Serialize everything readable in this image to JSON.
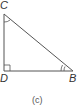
{
  "figure": {
    "caption": "(c)",
    "vertices": {
      "C": {
        "label": "C"
      },
      "D": {
        "label": "D"
      },
      "B": {
        "label": "B"
      }
    },
    "right_angle_at": "D",
    "angle_marks": {
      "C": "single-arc",
      "B": "double-arc"
    },
    "stroke_color": "#555555"
  }
}
